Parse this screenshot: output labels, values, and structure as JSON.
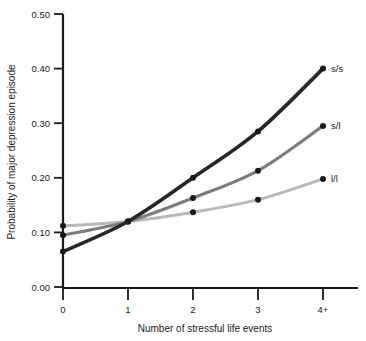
{
  "chart_data": {
    "type": "line",
    "title": "",
    "xlabel": "Number of stressful life events",
    "ylabel": "Probability of major depression episode",
    "categories": [
      "0",
      "1",
      "2",
      "3",
      "4+"
    ],
    "x": [
      0,
      1,
      2,
      3,
      4
    ],
    "xlim": [
      0,
      4
    ],
    "ylim": [
      0.0,
      0.5
    ],
    "yticks": [
      "0.00",
      "0.10",
      "0.20",
      "0.30",
      "0.40",
      "0.50"
    ],
    "ytick_values": [
      0.0,
      0.1,
      0.2,
      0.3,
      0.4,
      0.5
    ],
    "xticks": [
      "0",
      "1",
      "2",
      "3",
      "4+"
    ],
    "grid": false,
    "legend_position": "right-inline-endpoint-labels",
    "series": [
      {
        "name": "s/s",
        "label": "s/s",
        "color": "#272727",
        "values": [
          0.065,
          0.12,
          0.2,
          0.285,
          0.4
        ]
      },
      {
        "name": "s/l",
        "label": "s/l",
        "color": "#7d7d7d",
        "values": [
          0.095,
          0.12,
          0.163,
          0.213,
          0.295
        ]
      },
      {
        "name": "l/l",
        "label": "l/l",
        "color": "#b9b9b9",
        "values": [
          0.112,
          0.12,
          0.137,
          0.16,
          0.198
        ]
      }
    ]
  },
  "axis": {
    "y_label": "Probability of major depression episode",
    "x_label": "Number of stressful life events"
  },
  "labels": {
    "y0": "0.00",
    "y1": "0.10",
    "y2": "0.20",
    "y3": "0.30",
    "y4": "0.40",
    "y5": "0.50",
    "x0": "0",
    "x1": "1",
    "x2": "2",
    "x3": "3",
    "x4": "4+",
    "s_ss": "s/s",
    "s_sl": "s/l",
    "s_ll": "l/l"
  }
}
